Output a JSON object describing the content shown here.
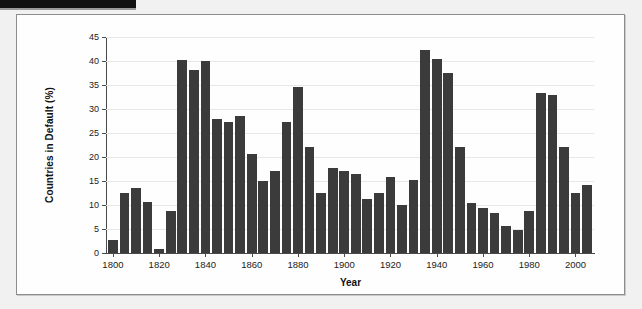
{
  "figure": {
    "frame_border_color": "#8d8d8d",
    "background_color": "#fefefe",
    "page_background": "#f1f1f1"
  },
  "chart_data": {
    "type": "bar",
    "title": "",
    "xlabel": "Year",
    "ylabel": "Countries in Default (%)",
    "xlim": [
      1797,
      2008
    ],
    "ylim": [
      0,
      45
    ],
    "ytick_labels": [
      "0",
      "5",
      "10",
      "15",
      "20",
      "25",
      "30",
      "35",
      "40",
      "45"
    ],
    "yticks": [
      0,
      5,
      10,
      15,
      20,
      25,
      30,
      35,
      40,
      45
    ],
    "xtick_labels": [
      "1800",
      "1820",
      "1840",
      "1860",
      "1880",
      "1900",
      "1920",
      "1940",
      "1960",
      "1980",
      "2000"
    ],
    "xticks": [
      1800,
      1820,
      1840,
      1860,
      1880,
      1900,
      1920,
      1940,
      1960,
      1980,
      2000
    ],
    "grid": "horizontal",
    "legend": "none",
    "bar_color": "#3b3b3b",
    "bar_width_years": 4.2,
    "categories": [
      1800,
      1805,
      1810,
      1815,
      1820,
      1825,
      1830,
      1835,
      1840,
      1845,
      1850,
      1855,
      1860,
      1865,
      1870,
      1875,
      1880,
      1885,
      1890,
      1895,
      1900,
      1905,
      1910,
      1915,
      1920,
      1925,
      1930,
      1935,
      1940,
      1945,
      1950,
      1955,
      1960,
      1965,
      1970,
      1975,
      1980,
      1985,
      1990,
      1995,
      2000,
      2005
    ],
    "values": [
      2.7,
      12.5,
      13.6,
      10.6,
      0.9,
      8.8,
      40.2,
      38.1,
      39.9,
      27.9,
      27.3,
      28.5,
      20.7,
      14.9,
      17.1,
      27.3,
      34.6,
      22.0,
      12.5,
      17.7,
      17.1,
      16.5,
      11.3,
      12.5,
      15.9,
      10.1,
      15.2,
      42.3,
      40.4,
      37.6,
      22.1,
      10.4,
      9.3,
      8.4,
      5.7,
      4.7,
      8.7,
      33.4,
      32.9,
      22.0,
      12.4,
      14.2
    ]
  }
}
